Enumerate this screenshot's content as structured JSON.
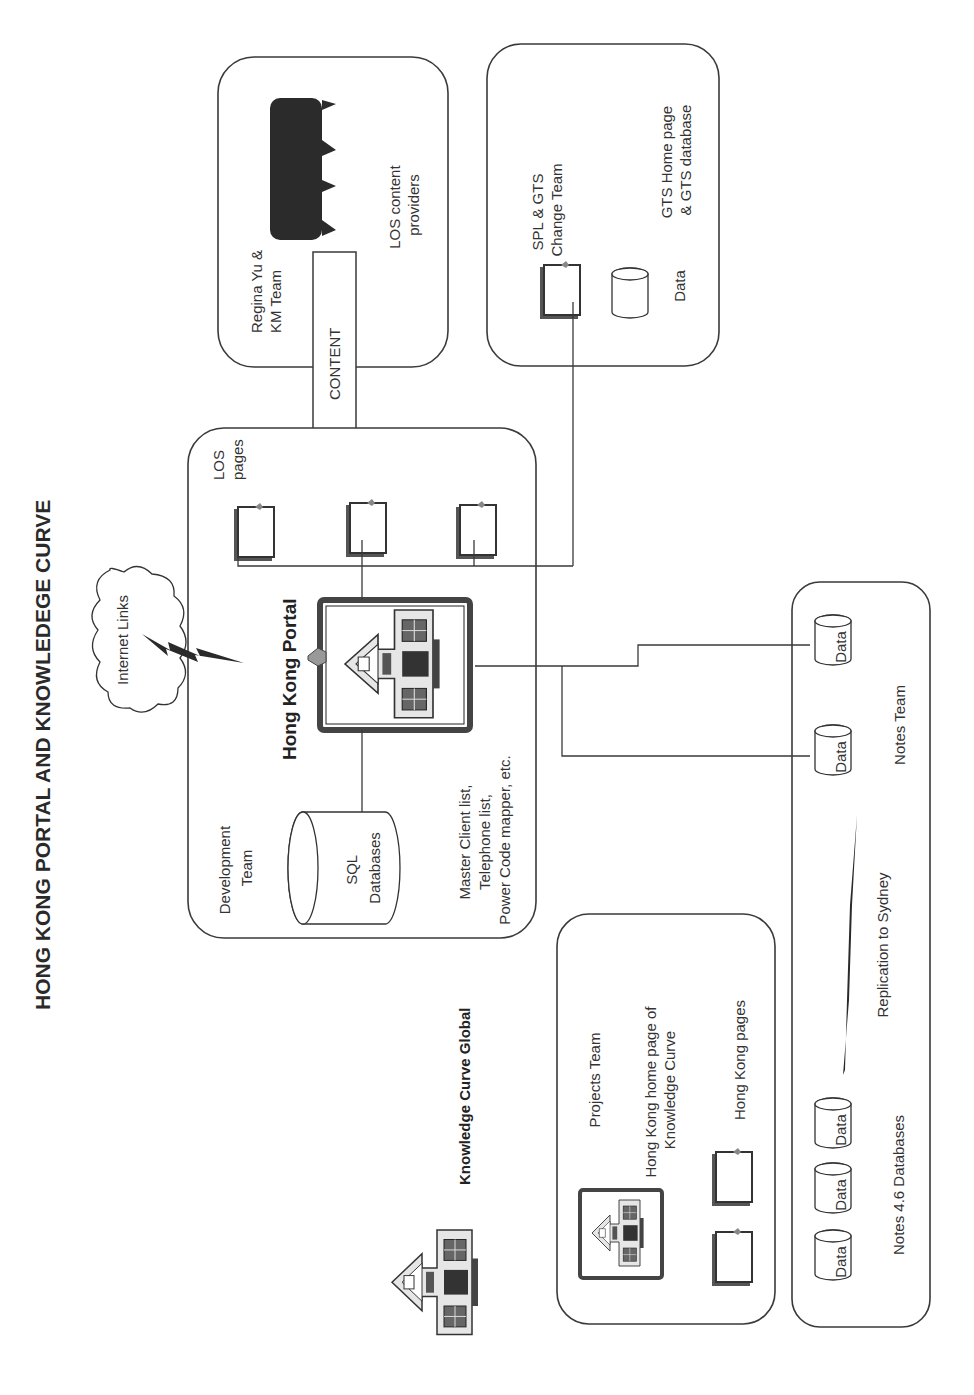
{
  "title": "HONG KONG PORTAL AND KNOWLEDEGE CURVE",
  "groups": {
    "km_team": {
      "team_label": [
        "Regina Yu &",
        "KM Team"
      ],
      "description": [
        "LOS content",
        "providers"
      ]
    },
    "spl_gts": {
      "team_label": [
        "SPL & GTS",
        "Change Team"
      ],
      "description": [
        "GTS Home page",
        "& GTS database"
      ],
      "database_label": "Data"
    },
    "portal": {
      "team_label": [
        "Development",
        "Team"
      ],
      "portal_label": "Hong Kong Portal",
      "pages_label": [
        "LOS",
        "pages"
      ],
      "sql_label": [
        "SQL",
        "Databases"
      ],
      "sql_description": [
        "Master Client list,",
        "Telephone list,",
        "Power Code mapper, etc."
      ]
    },
    "projects": {
      "team_label": "Projects Team",
      "home_label": [
        "Hong Kong home page of",
        "Knowledge Curve"
      ],
      "pages_label": "Hong Kong pages"
    },
    "notes": {
      "team_label": "Notes Team",
      "replication_label": "Replication to Sydney",
      "databases_label": "Notes 4.6 Databases",
      "database_labels": [
        "Data",
        "Data",
        "Data",
        "Data",
        "Data"
      ]
    }
  },
  "arrow_label": "CONTENT",
  "cloud_label": "Internet Links",
  "global_label": "Knowledge Curve Global",
  "colors": {
    "stroke": "#3a3a3a",
    "text": "#333333",
    "background": "#ffffff"
  }
}
